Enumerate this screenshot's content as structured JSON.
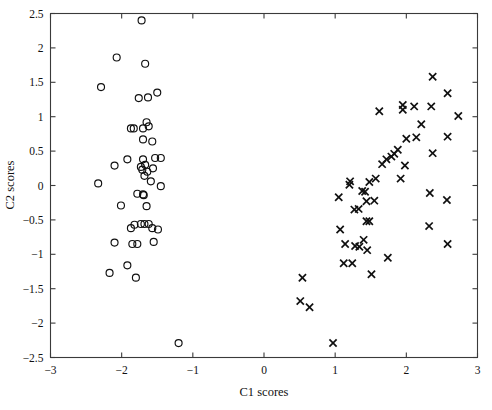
{
  "chart_data": {
    "type": "scatter",
    "title": "",
    "xlabel": "C1 scores",
    "ylabel": "C2 scores",
    "xlim": [
      -3,
      3
    ],
    "ylim": [
      -2.5,
      2.5
    ],
    "xticks": [
      -3,
      -2,
      -1,
      0,
      1,
      2,
      3
    ],
    "xtick_labels": [
      "−3",
      "−2",
      "−1",
      "0",
      "1",
      "2",
      "3"
    ],
    "yticks": [
      -2.5,
      -2,
      -1.5,
      -1,
      -0.5,
      0,
      0.5,
      1,
      1.5,
      2,
      2.5
    ],
    "ytick_labels": [
      "−2.5",
      "−2",
      "−1.5",
      "−1",
      "−0.5",
      "0",
      "0.5",
      "1",
      "1.5",
      "2",
      "2.5"
    ],
    "grid": false,
    "legend": null,
    "marker_color": "#101010",
    "axis_color": "#3a3a3a",
    "background": "#ffffff",
    "series": [
      {
        "name": "Group 1",
        "marker": "circle",
        "points": [
          [
            -1.72,
            2.4
          ],
          [
            -2.07,
            1.86
          ],
          [
            -1.67,
            1.77
          ],
          [
            -2.29,
            1.43
          ],
          [
            -1.5,
            1.35
          ],
          [
            -1.76,
            1.27
          ],
          [
            -1.63,
            1.28
          ],
          [
            -1.65,
            0.92
          ],
          [
            -1.87,
            0.83
          ],
          [
            -1.83,
            0.83
          ],
          [
            -1.7,
            0.83
          ],
          [
            -1.62,
            0.86
          ],
          [
            -1.7,
            0.67
          ],
          [
            -1.57,
            0.64
          ],
          [
            -1.92,
            0.38
          ],
          [
            -1.7,
            0.38
          ],
          [
            -1.53,
            0.4
          ],
          [
            -1.45,
            0.4
          ],
          [
            -2.1,
            0.29
          ],
          [
            -1.73,
            0.27
          ],
          [
            -1.67,
            0.3
          ],
          [
            -1.71,
            0.23
          ],
          [
            -1.56,
            0.25
          ],
          [
            -1.64,
            0.2
          ],
          [
            -1.68,
            0.14
          ],
          [
            -1.59,
            0.06
          ],
          [
            -2.33,
            0.03
          ],
          [
            -1.45,
            -0.01
          ],
          [
            -1.78,
            -0.12
          ],
          [
            -1.7,
            -0.13
          ],
          [
            -1.69,
            -0.14
          ],
          [
            -2.01,
            -0.29
          ],
          [
            -1.65,
            -0.3
          ],
          [
            -1.82,
            -0.57
          ],
          [
            -1.87,
            -0.62
          ],
          [
            -1.73,
            -0.56
          ],
          [
            -1.68,
            -0.56
          ],
          [
            -1.62,
            -0.56
          ],
          [
            -1.57,
            -0.62
          ],
          [
            -1.49,
            -0.64
          ],
          [
            -2.1,
            -0.83
          ],
          [
            -1.85,
            -0.85
          ],
          [
            -1.78,
            -0.85
          ],
          [
            -1.55,
            -0.82
          ],
          [
            -1.92,
            -1.16
          ],
          [
            -2.17,
            -1.27
          ],
          [
            -1.8,
            -1.34
          ],
          [
            -1.2,
            -2.29
          ]
        ]
      },
      {
        "name": "Group 2",
        "marker": "cross",
        "points": [
          [
            2.37,
            1.58
          ],
          [
            2.58,
            1.34
          ],
          [
            1.95,
            1.17
          ],
          [
            1.95,
            1.1
          ],
          [
            2.11,
            1.15
          ],
          [
            2.35,
            1.15
          ],
          [
            1.62,
            1.08
          ],
          [
            2.73,
            1.01
          ],
          [
            2.21,
            0.89
          ],
          [
            2.0,
            0.68
          ],
          [
            2.14,
            0.7
          ],
          [
            2.58,
            0.71
          ],
          [
            2.37,
            0.47
          ],
          [
            1.88,
            0.52
          ],
          [
            1.83,
            0.46
          ],
          [
            1.79,
            0.42
          ],
          [
            1.72,
            0.38
          ],
          [
            1.66,
            0.31
          ],
          [
            1.98,
            0.29
          ],
          [
            1.92,
            0.1
          ],
          [
            1.57,
            0.1
          ],
          [
            1.48,
            0.05
          ],
          [
            1.21,
            0.06
          ],
          [
            1.2,
            0.01
          ],
          [
            1.38,
            -0.08
          ],
          [
            1.42,
            -0.09
          ],
          [
            1.05,
            -0.17
          ],
          [
            1.44,
            -0.23
          ],
          [
            1.55,
            -0.22
          ],
          [
            2.33,
            -0.11
          ],
          [
            2.57,
            -0.21
          ],
          [
            1.27,
            -0.35
          ],
          [
            1.33,
            -0.34
          ],
          [
            1.44,
            -0.52
          ],
          [
            1.48,
            -0.52
          ],
          [
            1.07,
            -0.64
          ],
          [
            2.32,
            -0.59
          ],
          [
            1.4,
            -0.79
          ],
          [
            1.14,
            -0.85
          ],
          [
            1.28,
            -0.88
          ],
          [
            1.34,
            -0.89
          ],
          [
            1.45,
            -0.94
          ],
          [
            2.58,
            -0.85
          ],
          [
            1.74,
            -1.05
          ],
          [
            1.12,
            -1.13
          ],
          [
            1.24,
            -1.13
          ],
          [
            1.51,
            -1.29
          ],
          [
            0.54,
            -1.34
          ],
          [
            0.51,
            -1.68
          ],
          [
            0.64,
            -1.77
          ],
          [
            0.97,
            -2.29
          ]
        ]
      }
    ]
  }
}
